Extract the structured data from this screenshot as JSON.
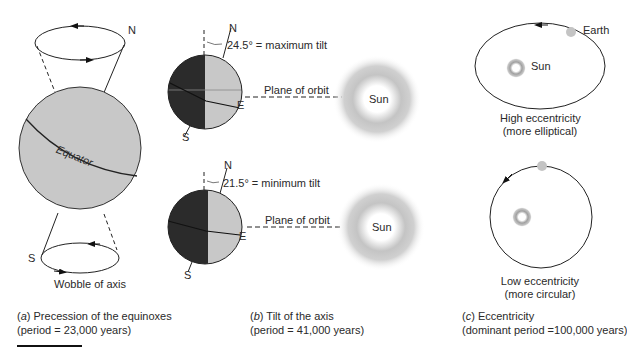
{
  "panels": {
    "a": {
      "label_letter": "a",
      "caption_line1": " Precession of the equinoxes",
      "caption_line2": "(period = 23,000 years)",
      "north_label": "N",
      "south_label": "S",
      "equator_label": "Equator",
      "wobble_label": "Wobble of axis"
    },
    "b": {
      "label_letter": "b",
      "caption_line1": " Tilt of the axis",
      "caption_line2": "(period = 41,000 years)",
      "top": {
        "north_label": "N",
        "south_label": "S",
        "east_label": "E",
        "tilt_label": "24.5° = maximum tilt",
        "orbit_label": "Plane of orbit",
        "sun_label": "Sun"
      },
      "bottom": {
        "north_label": "N",
        "south_label": "S",
        "east_label": "E",
        "tilt_label": "21.5° = minimum tilt",
        "orbit_label": "Plane of orbit",
        "sun_label": "Sun"
      }
    },
    "c": {
      "label_letter": "c",
      "caption_line1": " Eccentricity",
      "caption_line2": "(dominant period =100,000 years)",
      "high": {
        "earth_label": "Earth",
        "sun_label": "Sun",
        "desc_line1": "High eccentricity",
        "desc_line2": "(more elliptical)"
      },
      "low": {
        "desc_line1": "Low eccentricity",
        "desc_line2": "(more circular)"
      }
    }
  },
  "colors": {
    "sphere_light": "#c8c8c8",
    "sphere_dark": "#2b2b2b",
    "line": "#222222",
    "sun_glow": "#a8a8a8"
  }
}
